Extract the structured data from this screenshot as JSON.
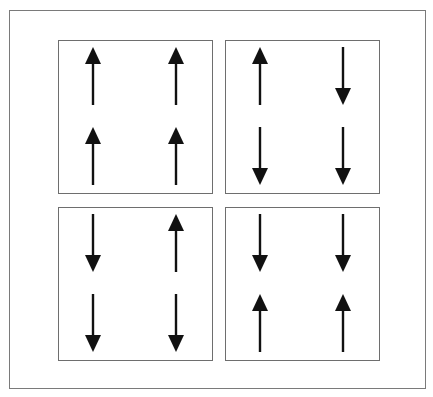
{
  "figure": {
    "panels": [
      {
        "id": "top-left",
        "arrows": [
          "up",
          "up",
          "up",
          "up"
        ]
      },
      {
        "id": "top-right",
        "arrows": [
          "up",
          "down",
          "down",
          "down"
        ]
      },
      {
        "id": "bottom-left",
        "arrows": [
          "down",
          "up",
          "down",
          "down"
        ]
      },
      {
        "id": "bottom-right",
        "arrows": [
          "down",
          "down",
          "up",
          "up"
        ]
      }
    ],
    "colors": {
      "arrow": "#111111",
      "border": "#707070",
      "background": "#ffffff"
    }
  }
}
